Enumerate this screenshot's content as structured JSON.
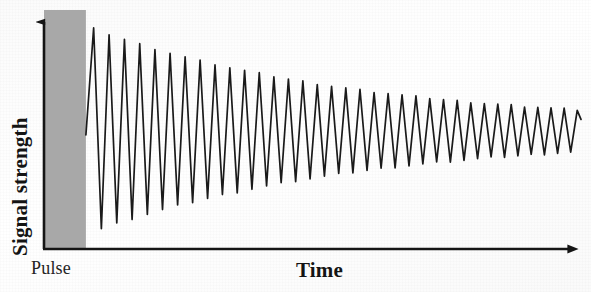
{
  "figure": {
    "background_color": "#fdfdfd",
    "ink_color": "#1a1a1a",
    "pulse_band_color": "#a8a8a8"
  },
  "axes": {
    "y_axis": {
      "label": "Signal strength",
      "name": "y-axis",
      "arrow": "up-arrow",
      "x_px": 43,
      "top_px": 12,
      "bottom_px": 249
    },
    "x_axis": {
      "label": "Time",
      "name": "x-axis",
      "arrow": "right-arrow",
      "y_px": 249,
      "left_px": 43,
      "right_px": 581
    }
  },
  "annotations": {
    "pulse_label": "Pulse"
  },
  "chart_data": {
    "type": "line",
    "title": "",
    "xlabel": "Time",
    "ylabel": "Signal strength",
    "subtitle": "",
    "grid": false,
    "legend": "none",
    "xlim": [
      0,
      1
    ],
    "ylim": [
      -1.05,
      1.05
    ],
    "axis_ticks": {
      "x": [],
      "y": []
    },
    "regions": [
      {
        "name": "pulse",
        "label": "Pulse",
        "x_start": 0.0,
        "x_end": 0.078,
        "fill": "#a8a8a8"
      }
    ],
    "series": [
      {
        "name": "signal",
        "color": "#1a1a1a",
        "line_width": 1.6,
        "model": "damped-sine",
        "signal_start_x": 0.078,
        "signal_end_x": 1.0,
        "baseline_value": 0.0,
        "baseline_y_px": 131,
        "initial_amplitude": 1.0,
        "final_amplitude": 0.16,
        "decay_constant": 1.86,
        "cycles": 33,
        "period_px_start": 15.5,
        "period_px_end": 13.0,
        "peak_y_px_first": 26,
        "trough_y_px_first": 238,
        "peak_y_px_last": 110,
        "trough_y_px_last": 142,
        "envelope_peaks": [
          {
            "x": 0.09,
            "y": 1.0
          },
          {
            "x": 0.15,
            "y": 0.94
          },
          {
            "x": 0.21,
            "y": 0.88
          },
          {
            "x": 0.27,
            "y": 0.82
          },
          {
            "x": 0.33,
            "y": 0.76
          },
          {
            "x": 0.4,
            "y": 0.68
          },
          {
            "x": 0.47,
            "y": 0.6
          },
          {
            "x": 0.54,
            "y": 0.52
          },
          {
            "x": 0.61,
            "y": 0.45
          },
          {
            "x": 0.68,
            "y": 0.38
          },
          {
            "x": 0.76,
            "y": 0.31
          },
          {
            "x": 0.84,
            "y": 0.25
          },
          {
            "x": 0.92,
            "y": 0.2
          },
          {
            "x": 1.0,
            "y": 0.16
          }
        ]
      }
    ]
  }
}
